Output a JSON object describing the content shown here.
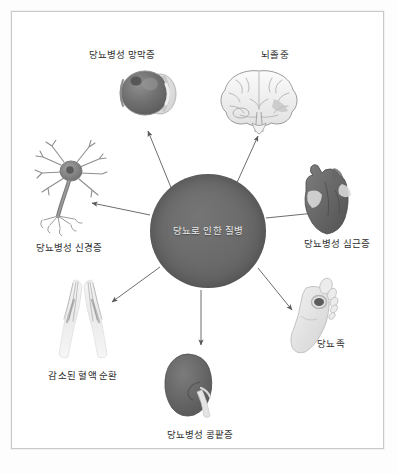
{
  "figure": {
    "center": {
      "label": "당뇨로 인한 질병",
      "color": "#6b6b6b"
    },
    "border_color": "#c9c9c9",
    "background": "#ffffff",
    "text_color": "#2e2e2e",
    "nodes": [
      {
        "id": "retinopathy",
        "label": "당뇨병성 망막증",
        "icon": "eye-illustration",
        "direction": "up-left"
      },
      {
        "id": "stroke",
        "label": "뇌졸중",
        "icon": "brain-illustration",
        "direction": "up-right"
      },
      {
        "id": "neuropathy",
        "label": "당뇨병성 신경증",
        "icon": "neuron-illustration",
        "direction": "left"
      },
      {
        "id": "cardiomyopathy",
        "label": "당뇨병성 심근증",
        "icon": "heart-illustration",
        "direction": "right"
      },
      {
        "id": "circulation",
        "label": "감소된 혈액 순환",
        "icon": "legs-illustration",
        "direction": "down-left"
      },
      {
        "id": "diabetic-foot",
        "label": "당뇨족",
        "icon": "foot-illustration",
        "direction": "down-right"
      },
      {
        "id": "nephropathy",
        "label": "당뇨병성 콩팥증",
        "icon": "kidney-illustration",
        "direction": "down"
      }
    ]
  }
}
